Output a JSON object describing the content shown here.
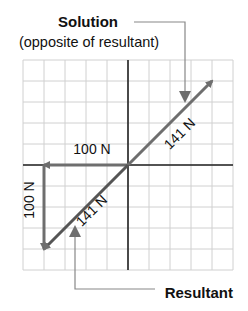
{
  "diagram": {
    "labels": {
      "solution_title": "Solution",
      "solution_subtitle": "(opposite of resultant)",
      "resultant": "Resultant"
    },
    "grid": {
      "columns": 10,
      "rows": 10
    },
    "vectors": [
      {
        "name": "horizontal-force",
        "label": "100 N",
        "from": [
          0,
          0
        ],
        "to": [
          -4,
          0
        ],
        "color": "#6e6e6e"
      },
      {
        "name": "vertical-force",
        "label": "100 N",
        "from": [
          -4,
          0
        ],
        "to": [
          -4,
          -4
        ],
        "color": "#6e6e6e"
      },
      {
        "name": "resultant",
        "label": "141 N",
        "from": [
          0,
          0
        ],
        "to": [
          -4,
          -4
        ],
        "color": "#555555"
      },
      {
        "name": "solution",
        "label": "141 N",
        "from": [
          0,
          0
        ],
        "to": [
          4,
          4
        ],
        "color": "#6e6e6e"
      }
    ],
    "colors": {
      "grid": "#d0d0d0",
      "axis": "#222222",
      "arrow": "#6e6e6e",
      "callout": "#888888"
    }
  }
}
